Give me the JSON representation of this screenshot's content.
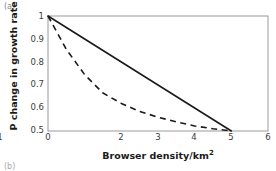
{
  "figure": {
    "panel_label": "(a)",
    "panel_label_next": "(b)"
  },
  "chart_data": {
    "type": "line",
    "title": "",
    "xlabel": "Browser density/km",
    "xlabel_sup": "2",
    "xlabel_full": "Browser density/km²",
    "ylabel": "P change in growth rate",
    "xlim": [
      0,
      6
    ],
    "ylim": [
      0.5,
      1.0
    ],
    "xticks": [
      0,
      1,
      2,
      3,
      4,
      5,
      6
    ],
    "xtick_labels": [
      "0",
      "1",
      "2",
      "3",
      "4",
      "5",
      "6"
    ],
    "yticks": [
      0.5,
      0.6,
      0.7,
      0.8,
      0.9,
      1.0
    ],
    "ytick_labels": [
      "0.5",
      "0.6",
      "0.7",
      "0.8",
      "0.9",
      "1"
    ],
    "grid": false,
    "legend": null,
    "axis_color": "#9a9a9a",
    "series": [
      {
        "name": "linear decline",
        "style": "solid",
        "color": "#1a1a1a",
        "x": [
          0,
          1,
          2,
          3,
          4,
          5
        ],
        "values": [
          1.0,
          0.9,
          0.8,
          0.7,
          0.6,
          0.5
        ]
      },
      {
        "name": "convex decline",
        "style": "dashed",
        "color": "#1a1a1a",
        "x": [
          0,
          0.5,
          1,
          1.5,
          2,
          2.5,
          3,
          3.5,
          4,
          4.5,
          5
        ],
        "values": [
          1.0,
          0.855,
          0.745,
          0.665,
          0.62,
          0.585,
          0.56,
          0.54,
          0.522,
          0.51,
          0.5
        ]
      }
    ]
  }
}
